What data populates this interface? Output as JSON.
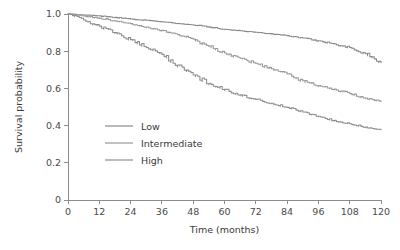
{
  "chart_data": {
    "type": "line",
    "title": "",
    "subtitle": "",
    "xlabel": "Time (months)",
    "ylabel": "Survival probability",
    "xlim": [
      0,
      120
    ],
    "ylim": [
      0,
      1.0
    ],
    "xticks": [
      0,
      12,
      24,
      36,
      48,
      60,
      72,
      84,
      96,
      108,
      120
    ],
    "xtick_labels": [
      "0",
      "12",
      "24",
      "36",
      "48",
      "60",
      "72",
      "84",
      "96",
      "108",
      "120"
    ],
    "yticks": [
      0,
      0.2,
      0.4,
      0.6,
      0.8,
      1.0
    ],
    "ytick_labels": [
      "0",
      "0.2",
      "0.4",
      "0.6",
      "0.8",
      "1.0"
    ],
    "grid": false,
    "legend_position": "center-left-inside",
    "x": [
      0,
      6,
      12,
      18,
      24,
      30,
      36,
      42,
      48,
      54,
      60,
      66,
      72,
      78,
      84,
      90,
      96,
      102,
      108,
      114,
      120
    ],
    "series": [
      {
        "name": "Low",
        "color": "#8a8a8a",
        "values": [
          1.0,
          0.995,
          0.99,
          0.982,
          0.973,
          0.966,
          0.958,
          0.949,
          0.941,
          0.931,
          0.918,
          0.91,
          0.902,
          0.893,
          0.884,
          0.871,
          0.856,
          0.84,
          0.82,
          0.786,
          0.74
        ]
      },
      {
        "name": "Intermediate",
        "color": "#9a9a9a",
        "values": [
          1.0,
          0.99,
          0.978,
          0.963,
          0.948,
          0.93,
          0.912,
          0.889,
          0.865,
          0.828,
          0.79,
          0.762,
          0.735,
          0.706,
          0.678,
          0.641,
          0.615,
          0.596,
          0.572,
          0.548,
          0.53
        ]
      },
      {
        "name": "High",
        "color": "#8f8f8f",
        "values": [
          1.0,
          0.968,
          0.935,
          0.9,
          0.862,
          0.82,
          0.783,
          0.726,
          0.672,
          0.628,
          0.595,
          0.565,
          0.541,
          0.52,
          0.498,
          0.473,
          0.45,
          0.428,
          0.41,
          0.392,
          0.378
        ]
      }
    ],
    "legend": [
      {
        "label": "Low",
        "color": "#8a8a8a"
      },
      {
        "label": "Intermediate",
        "color": "#9a9a9a"
      },
      {
        "label": "High",
        "color": "#8f8f8f"
      }
    ]
  },
  "axis": {
    "x_title": "Time (months)",
    "y_title": "Survival probability"
  }
}
